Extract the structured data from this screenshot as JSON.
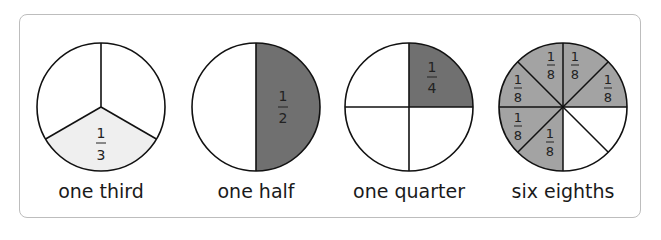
{
  "colors": {
    "light_fill": "#efefef",
    "dark_fill": "#707070",
    "mid_fill": "#a3a3a3",
    "stroke": "#111111"
  },
  "pies": [
    {
      "name": "one-third",
      "caption": "one third",
      "fraction": "1/3",
      "numerator": "1",
      "denominator": "3"
    },
    {
      "name": "one-half",
      "caption": "one half",
      "fraction": "1/2",
      "numerator": "1",
      "denominator": "2"
    },
    {
      "name": "one-quarter",
      "caption": "one quarter",
      "fraction": "1/4",
      "numerator": "1",
      "denominator": "4"
    },
    {
      "name": "six-eighths",
      "caption": "six eighths",
      "fraction": "6/8",
      "numerator": "1",
      "denominator": "8"
    }
  ]
}
